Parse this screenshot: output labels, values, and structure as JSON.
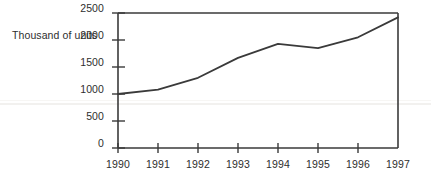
{
  "chart_data": {
    "type": "line",
    "title": "",
    "subtitle": "",
    "xlabel": "",
    "ylabel": "Thousand of units",
    "categories": [
      "1990",
      "1991",
      "1992",
      "1993",
      "1994",
      "1995",
      "1996",
      "1997"
    ],
    "x": [
      1990,
      1991,
      1992,
      1993,
      1994,
      1995,
      1996,
      1997
    ],
    "values": [
      1000,
      1080,
      1300,
      1670,
      1930,
      1850,
      2050,
      2420
    ],
    "series": [
      {
        "name": "Thousand of units",
        "values": [
          1000,
          1080,
          1300,
          1670,
          1930,
          1850,
          2050,
          2420
        ]
      }
    ],
    "xlim": [
      1990,
      1997
    ],
    "ylim": [
      0,
      2500
    ],
    "ytick_labels": [
      "0",
      "500",
      "1000",
      "1500",
      "2000",
      "2500"
    ],
    "ytick_values": [
      0,
      500,
      1000,
      1500,
      2000,
      2500
    ],
    "xtick_labels": [
      "1990",
      "1991",
      "1992",
      "1993",
      "1994",
      "1995",
      "1996",
      "1997"
    ],
    "grid": false,
    "legend": false,
    "legend_position": "none",
    "line_color": "#3a3a3a",
    "axis_color": "#3a3a3a",
    "background_color": "#ffffff",
    "annotations": []
  },
  "axis": {
    "y_title": "Thousand of units"
  }
}
